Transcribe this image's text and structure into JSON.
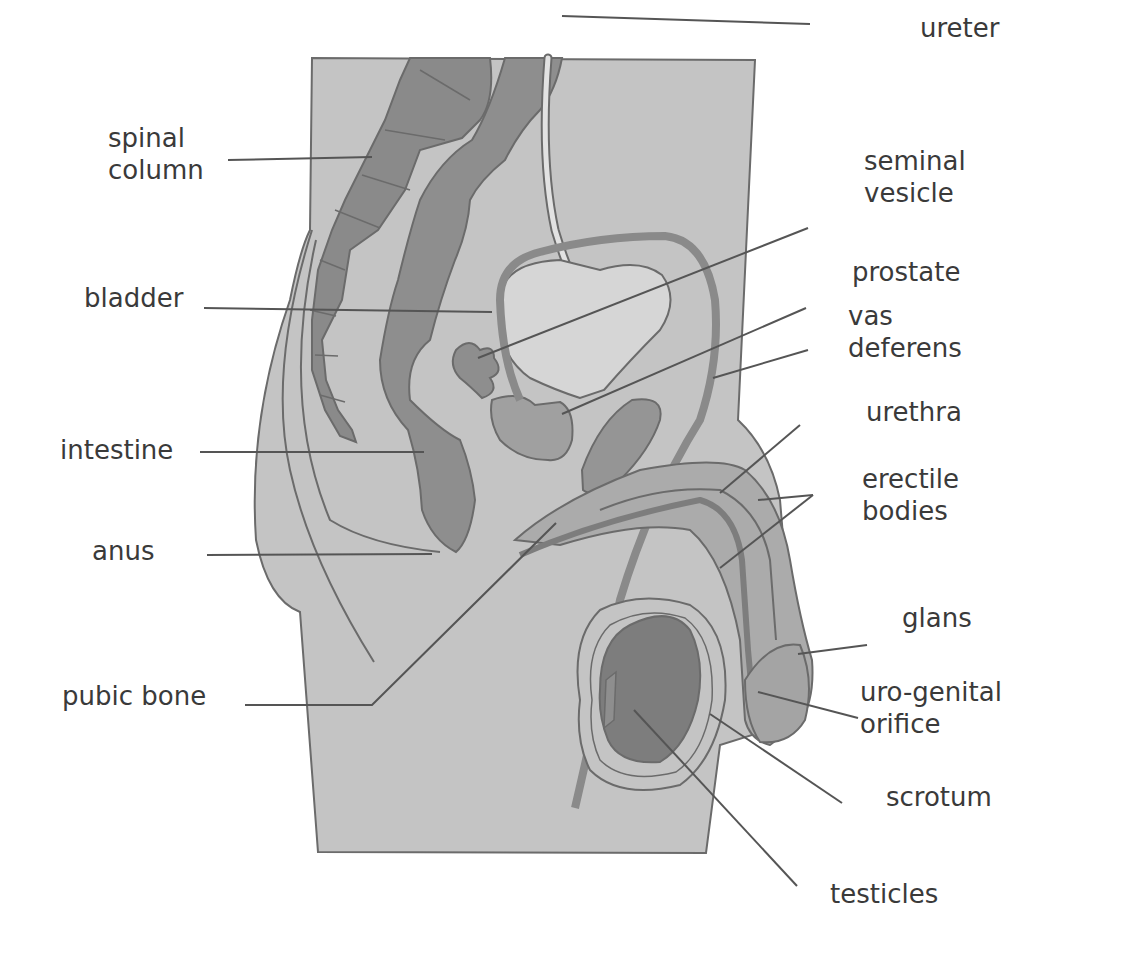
{
  "diagram": {
    "colors": {
      "background": "#ffffff",
      "body": "#c4c4c4",
      "bone": "#8a8a8a",
      "intestine": "#8e8e8e",
      "organ_light": "#d6d6d6",
      "organ_mid": "#a9a9a9",
      "organ_dark": "#7d7d7d",
      "outline": "#6b6b6b",
      "leader_line": "#555555",
      "text": "#3a3a3a"
    }
  },
  "labels": [
    {
      "id": "ureter",
      "text": "ureter",
      "x": 920,
      "y": 12,
      "leader": [
        [
          562,
          16
        ],
        [
          810,
          24
        ]
      ]
    },
    {
      "id": "spinal-column",
      "text": "spinal\ncolumn",
      "x": 108,
      "y": 122,
      "leader": [
        [
          228,
          160
        ],
        [
          372,
          157
        ]
      ]
    },
    {
      "id": "seminal-vesicle",
      "text": "seminal\nvesicle",
      "x": 864,
      "y": 145,
      "leader": [
        [
          808,
          228
        ],
        [
          478,
          358
        ]
      ]
    },
    {
      "id": "bladder",
      "text": "bladder",
      "x": 84,
      "y": 282,
      "leader": [
        [
          204,
          308
        ],
        [
          492,
          312
        ]
      ]
    },
    {
      "id": "prostate",
      "text": "prostate",
      "x": 852,
      "y": 256,
      "leader": [
        [
          806,
          308
        ],
        [
          562,
          414
        ]
      ]
    },
    {
      "id": "vas-deferens",
      "text": "vas\ndeferens",
      "x": 848,
      "y": 300,
      "leader": [
        [
          808,
          350
        ],
        [
          713,
          378
        ]
      ]
    },
    {
      "id": "urethra",
      "text": "urethra",
      "x": 866,
      "y": 396,
      "leader": [
        [
          800,
          425
        ],
        [
          720,
          493
        ]
      ]
    },
    {
      "id": "intestine",
      "text": "intestine",
      "x": 60,
      "y": 434,
      "leader": [
        [
          200,
          452
        ],
        [
          424,
          452
        ]
      ]
    },
    {
      "id": "erectile-bodies",
      "text": "erectile\nbodies",
      "x": 862,
      "y": 463,
      "leader": [
        [
          813,
          495
        ],
        [
          758,
          500
        ]
      ],
      "leader2": [
        [
          813,
          495
        ],
        [
          720,
          568
        ]
      ]
    },
    {
      "id": "anus",
      "text": "anus",
      "x": 92,
      "y": 535,
      "leader": [
        [
          207,
          555
        ],
        [
          432,
          554
        ]
      ]
    },
    {
      "id": "glans",
      "text": "glans",
      "x": 902,
      "y": 602,
      "leader": [
        [
          867,
          645
        ],
        [
          798,
          654
        ]
      ]
    },
    {
      "id": "pubic-bone",
      "text": "pubic bone",
      "x": 62,
      "y": 680,
      "leader": [
        [
          245,
          705
        ],
        [
          372,
          705
        ],
        [
          556,
          523
        ]
      ]
    },
    {
      "id": "uro-genital-orifice",
      "text": "uro-genital\norifice",
      "x": 860,
      "y": 676,
      "leader": [
        [
          858,
          718
        ],
        [
          758,
          692
        ]
      ]
    },
    {
      "id": "scrotum",
      "text": "scrotum",
      "x": 886,
      "y": 781,
      "leader": [
        [
          842,
          803
        ],
        [
          710,
          714
        ]
      ]
    },
    {
      "id": "testicles",
      "text": "testicles",
      "x": 830,
      "y": 878,
      "leader": [
        [
          797,
          886
        ],
        [
          634,
          710
        ]
      ]
    }
  ]
}
